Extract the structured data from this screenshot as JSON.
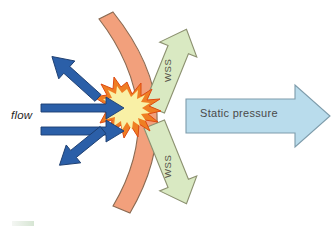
{
  "figure": {
    "type": "schematic-diagram",
    "background_color": "#ffffff",
    "width": 335,
    "height": 229
  },
  "labels": {
    "flow": "flow",
    "static_pressure": "Static pressure",
    "wss_top": "WSS",
    "wss_bottom": "WSS"
  },
  "elements": {
    "arterial_wall": {
      "name": "arterial-wall",
      "fill": "#F2A07C",
      "stroke": "#8C6A54",
      "shape": "curved-band"
    },
    "impact_burst": {
      "name": "impact-burst",
      "fill": "#F7EFA8",
      "ray_fill": "#F0872F",
      "ray_stroke": "#E04A16",
      "shape": "starburst"
    },
    "flow_arrows": {
      "name": "flow-arrows",
      "fill": "#2B5FA8",
      "stroke": "#1B3C6E",
      "count": 4,
      "directions": [
        "right-upper",
        "right-lower",
        "up-left",
        "down-left"
      ]
    },
    "wss_arrows": {
      "name": "wss-arrows",
      "fill": "#D9E9C2",
      "stroke": "#8C9170",
      "count": 2,
      "directions": [
        "up-right",
        "down-left"
      ]
    },
    "static_pressure_arrow": {
      "name": "static-pressure-arrow",
      "fill": "#B9DCEC",
      "stroke": "#7C9BAA",
      "direction": "right"
    }
  },
  "colors": {
    "wall": "#F2A07C",
    "burst_core": "#F7EFA8",
    "burst_rays": "#EF7E23",
    "flow_blue": "#2B5FA8",
    "wss_green": "#D9E9C2",
    "pressure_blue": "#B9DCEC",
    "text": "#3a3a3a"
  }
}
